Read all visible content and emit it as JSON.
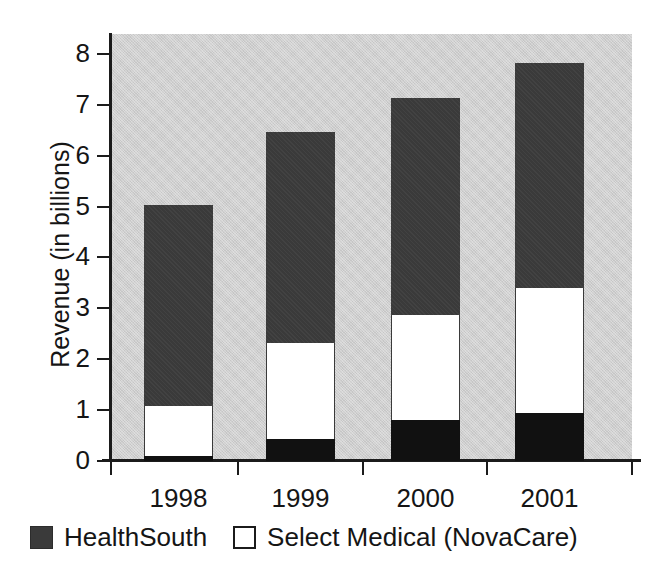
{
  "chart_data": {
    "type": "bar",
    "subtype": "stacked-bar",
    "title": "",
    "xlabel": "",
    "ylabel": "Revenue (in billions)",
    "categories": [
      "1998",
      "1999",
      "2000",
      "2001"
    ],
    "ylim": [
      0,
      8
    ],
    "y_ticks": [
      "0",
      "1",
      "2",
      "3",
      "4",
      "5",
      "6",
      "7",
      "8"
    ],
    "grid": false,
    "legend_position": "bottom-left",
    "series": [
      {
        "name": "Select Medical (NovaCare)",
        "swatch": "outline",
        "color": "#ffffff",
        "values": [
          0.98,
          1.89,
          2.07,
          2.46
        ]
      },
      {
        "name": "HealthSouth",
        "swatch": "filled",
        "color": "#3a3a3a",
        "values": [
          3.95,
          4.14,
          4.26,
          4.42
        ]
      }
    ],
    "stack_order_bottom_to_top": [
      "bottom-black",
      "Select Medical (NovaCare)",
      "HealthSouth"
    ],
    "bars": [
      {
        "category": "1998",
        "total": 5.03,
        "segments": [
          {
            "name": "bottom-black",
            "color": "#111111",
            "from": 0.0,
            "to": 0.1
          },
          {
            "name": "Select Medical (NovaCare)",
            "color": "#ffffff",
            "from": 0.1,
            "to": 1.08
          },
          {
            "name": "HealthSouth",
            "color": "#3a3a3a",
            "from": 1.08,
            "to": 5.03
          }
        ]
      },
      {
        "category": "1999",
        "total": 6.46,
        "segments": [
          {
            "name": "bottom-black",
            "color": "#111111",
            "from": 0.0,
            "to": 0.43
          },
          {
            "name": "Select Medical (NovaCare)",
            "color": "#ffffff",
            "from": 0.43,
            "to": 2.32
          },
          {
            "name": "HealthSouth",
            "color": "#3a3a3a",
            "from": 2.32,
            "to": 6.46
          }
        ]
      },
      {
        "category": "2000",
        "total": 7.13,
        "segments": [
          {
            "name": "bottom-black",
            "color": "#111111",
            "from": 0.0,
            "to": 0.8
          },
          {
            "name": "Select Medical (NovaCare)",
            "color": "#ffffff",
            "from": 0.8,
            "to": 2.87
          },
          {
            "name": "HealthSouth",
            "color": "#3a3a3a",
            "from": 2.87,
            "to": 7.13
          }
        ]
      },
      {
        "category": "2001",
        "total": 7.82,
        "segments": [
          {
            "name": "bottom-black",
            "color": "#111111",
            "from": 0.0,
            "to": 0.94
          },
          {
            "name": "Select Medical (NovaCare)",
            "color": "#ffffff",
            "from": 0.94,
            "to": 3.4
          },
          {
            "name": "HealthSouth",
            "color": "#3a3a3a",
            "from": 3.4,
            "to": 7.82
          }
        ]
      }
    ]
  },
  "legend": {
    "entries": [
      {
        "label": "HealthSouth",
        "swatch": "filled"
      },
      {
        "label": "Select Medical (NovaCare)",
        "swatch": "outline"
      }
    ]
  },
  "colors": {
    "plot_background": "#cfcfcf",
    "series_dark": "#3a3a3a",
    "series_white": "#ffffff",
    "series_black": "#111111",
    "axis": "#1b1b1b",
    "text": "#151515",
    "page_background": "#ffffff"
  },
  "layout": {
    "plot_left": 111,
    "plot_right": 632,
    "plot_top": 34,
    "baseline_y": 461,
    "px_per_unit": 50.9,
    "bar_width": 69,
    "bar_centers_x": [
      178.5,
      300.5,
      425.5,
      549.5
    ]
  }
}
